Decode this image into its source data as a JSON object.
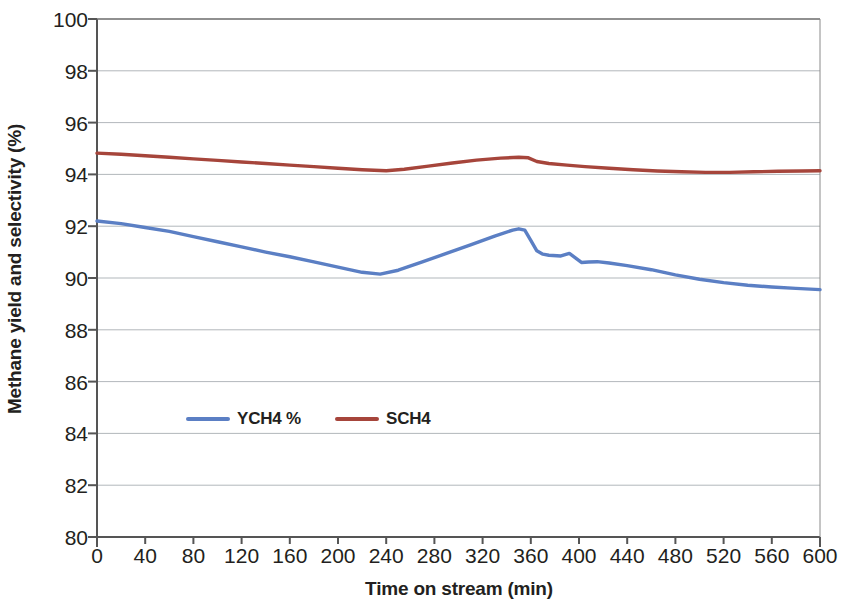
{
  "chart_data": {
    "type": "line",
    "title": "",
    "xlabel": "Time on stream (min)",
    "ylabel": "Methane yield and selectivity (%)",
    "xlim": [
      0,
      600
    ],
    "ylim": [
      80,
      100
    ],
    "xticks": [
      0,
      40,
      80,
      120,
      160,
      200,
      240,
      280,
      320,
      360,
      400,
      440,
      480,
      520,
      560,
      600
    ],
    "yticks": [
      80,
      82,
      84,
      86,
      88,
      90,
      92,
      94,
      96,
      98,
      100
    ],
    "grid": "horizontal",
    "legend_position": "inside-center-lower",
    "series": [
      {
        "name": "YCH4 %",
        "color": "#5b7fc4",
        "x": [
          0,
          20,
          40,
          60,
          80,
          100,
          120,
          140,
          160,
          180,
          200,
          220,
          235,
          250,
          270,
          290,
          310,
          330,
          345,
          350,
          355,
          360,
          365,
          370,
          375,
          385,
          392,
          397,
          402,
          408,
          415,
          425,
          440,
          460,
          480,
          500,
          520,
          540,
          560,
          580,
          600
        ],
        "y": [
          92.2,
          92.1,
          91.95,
          91.8,
          91.6,
          91.4,
          91.2,
          91.0,
          90.82,
          90.62,
          90.42,
          90.22,
          90.15,
          90.3,
          90.62,
          90.95,
          91.28,
          91.62,
          91.85,
          91.9,
          91.85,
          91.45,
          91.05,
          90.92,
          90.88,
          90.85,
          90.95,
          90.78,
          90.6,
          90.62,
          90.63,
          90.58,
          90.48,
          90.32,
          90.12,
          89.95,
          89.82,
          89.72,
          89.65,
          89.6,
          89.55
        ]
      },
      {
        "name": "SCH4",
        "color": "#a6453b",
        "x": [
          0,
          20,
          40,
          60,
          80,
          100,
          120,
          140,
          160,
          180,
          200,
          220,
          240,
          255,
          275,
          295,
          315,
          335,
          350,
          358,
          365,
          375,
          390,
          405,
          425,
          445,
          465,
          485,
          505,
          525,
          545,
          565,
          585,
          600
        ],
        "y": [
          94.82,
          94.78,
          94.72,
          94.66,
          94.6,
          94.54,
          94.48,
          94.42,
          94.36,
          94.3,
          94.24,
          94.18,
          94.14,
          94.2,
          94.32,
          94.44,
          94.55,
          94.63,
          94.66,
          94.64,
          94.5,
          94.42,
          94.36,
          94.3,
          94.24,
          94.18,
          94.13,
          94.1,
          94.08,
          94.08,
          94.1,
          94.12,
          94.13,
          94.14
        ]
      }
    ]
  },
  "axes": {
    "y_tick_labels": [
      "100",
      "98",
      "96",
      "94",
      "92",
      "90",
      "88",
      "86",
      "84",
      "82",
      "80"
    ],
    "x_tick_labels": [
      "0",
      "40",
      "80",
      "120",
      "160",
      "200",
      "240",
      "280",
      "320",
      "360",
      "400",
      "440",
      "480",
      "520",
      "560",
      "600"
    ],
    "y_axis_title": "Methane yield and selectivity (%)",
    "x_axis_title": "Time on stream (min)"
  },
  "legend": {
    "items": [
      {
        "label": "YCH4 %",
        "color": "#5b7fc4"
      },
      {
        "label": "SCH4",
        "color": "#a6453b"
      }
    ]
  },
  "colors": {
    "yield_series": "#5b7fc4",
    "selectivity_series": "#a6453b",
    "axis": "#555555",
    "gridline": "#9aa0a6",
    "text": "#231f20",
    "background": "#ffffff"
  }
}
